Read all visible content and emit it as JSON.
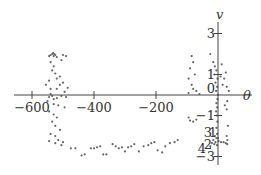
{
  "chart_data": {
    "type": "scatter",
    "title": "",
    "xlabel": "θ",
    "ylabel": "v",
    "xlim": [
      -650,
      40
    ],
    "ylim": [
      -3.3,
      3.8
    ],
    "grid": false,
    "legend": null,
    "x_ticks": [
      -600,
      -400,
      -200
    ],
    "x_tick_labels": [
      "−600",
      "−400",
      "−200"
    ],
    "y_ticks": [
      3,
      1,
      0,
      -1,
      -3
    ],
    "y_tick_labels": [
      "3",
      "1",
      "0",
      "−1",
      "−3"
    ],
    "overlapping_labels_near_origin_bottom": [
      "3",
      "1",
      "4",
      "2"
    ],
    "axes_origin": [
      0,
      0
    ],
    "marker_color": "#666666",
    "series": [
      {
        "name": "trajectory",
        "points": [
          [
            -535,
            2.0
          ],
          [
            -532,
            2.05
          ],
          [
            -528,
            2.0
          ],
          [
            -525,
            1.95
          ],
          [
            -530,
            1.9
          ],
          [
            -540,
            1.95
          ],
          [
            -545,
            1.9
          ],
          [
            -520,
            1.85
          ],
          [
            -500,
            1.95
          ],
          [
            -490,
            1.9
          ],
          [
            -505,
            1.7
          ],
          [
            -540,
            1.6
          ],
          [
            -530,
            1.4
          ],
          [
            -535,
            1.2
          ],
          [
            -525,
            1.05
          ],
          [
            -520,
            0.8
          ],
          [
            -510,
            0.9
          ],
          [
            -500,
            0.6
          ],
          [
            -545,
            0.7
          ],
          [
            -555,
            0.5
          ],
          [
            -540,
            0.3
          ],
          [
            -520,
            0.3
          ],
          [
            -510,
            0.5
          ],
          [
            -495,
            0.15
          ],
          [
            -485,
            0.35
          ],
          [
            -540,
            0.05
          ],
          [
            -535,
            -0.05
          ],
          [
            -545,
            -0.1
          ],
          [
            -530,
            -0.2
          ],
          [
            -520,
            -0.15
          ],
          [
            -505,
            -0.05
          ],
          [
            -490,
            -0.1
          ],
          [
            -550,
            -0.3
          ],
          [
            -530,
            -0.45
          ],
          [
            -515,
            -0.5
          ],
          [
            -495,
            -0.6
          ],
          [
            -545,
            -0.8
          ],
          [
            -530,
            -0.95
          ],
          [
            -520,
            -1.1
          ],
          [
            -535,
            -1.3
          ],
          [
            -525,
            -1.5
          ],
          [
            -510,
            -1.7
          ],
          [
            -540,
            -1.9
          ],
          [
            -525,
            -2.0
          ],
          [
            -515,
            -2.2
          ],
          [
            -500,
            -2.3
          ],
          [
            -545,
            -2.25
          ],
          [
            -525,
            -2.35
          ],
          [
            -505,
            -2.45
          ],
          [
            -475,
            -2.6
          ],
          [
            -460,
            -2.6
          ],
          [
            -440,
            -2.95
          ],
          [
            -430,
            -2.9
          ],
          [
            -410,
            -2.6
          ],
          [
            -400,
            -2.6
          ],
          [
            -390,
            -2.55
          ],
          [
            -380,
            -2.5
          ],
          [
            -370,
            -2.9
          ],
          [
            -360,
            -2.9
          ],
          [
            -340,
            -2.4
          ],
          [
            -330,
            -2.5
          ],
          [
            -320,
            -2.6
          ],
          [
            -310,
            -2.55
          ],
          [
            -300,
            -2.75
          ],
          [
            -290,
            -2.55
          ],
          [
            -280,
            -2.5
          ],
          [
            -270,
            -2.4
          ],
          [
            -255,
            -2.75
          ],
          [
            -240,
            -2.5
          ],
          [
            -225,
            -2.45
          ],
          [
            -215,
            -2.35
          ],
          [
            -205,
            -2.3
          ],
          [
            -195,
            -2.7
          ],
          [
            -180,
            -2.8
          ],
          [
            -170,
            -2.5
          ],
          [
            -155,
            -2.35
          ],
          [
            -140,
            -2.3
          ],
          [
            -130,
            -2.2
          ],
          [
            -85,
            1.9
          ],
          [
            -80,
            1.6
          ],
          [
            -90,
            1.3
          ],
          [
            -75,
            1.0
          ],
          [
            -95,
            0.8
          ],
          [
            -85,
            0.5
          ],
          [
            -80,
            0.3
          ],
          [
            -95,
            0.1
          ],
          [
            -70,
            0.2
          ],
          [
            -60,
            0.05
          ],
          [
            -95,
            -1.1
          ],
          [
            -90,
            -1.25
          ],
          [
            -80,
            -1.3
          ],
          [
            -70,
            -1.2
          ],
          [
            -25,
            2.0
          ],
          [
            -15,
            1.6
          ],
          [
            -10,
            1.4
          ],
          [
            -5,
            1.2
          ],
          [
            -12,
            1.0
          ],
          [
            -2,
            0.8
          ],
          [
            -8,
            0.6
          ],
          [
            -3,
            0.4
          ],
          [
            -6,
            0.2
          ],
          [
            0,
            0.0
          ],
          [
            -2,
            -0.2
          ],
          [
            -5,
            -0.4
          ],
          [
            -3,
            -0.6
          ],
          [
            -6,
            -0.8
          ],
          [
            -4,
            -1.0
          ],
          [
            -2,
            -1.3
          ],
          [
            -5,
            -1.6
          ],
          [
            -3,
            -1.9
          ],
          [
            -10,
            -2.0
          ],
          [
            -5,
            -2.1
          ],
          [
            0,
            -2.1
          ],
          [
            -15,
            -2.2
          ],
          [
            -8,
            -2.3
          ],
          [
            2,
            -2.25
          ],
          [
            -20,
            -2.35
          ],
          [
            -12,
            -2.4
          ],
          [
            -3,
            -2.45
          ],
          [
            -25,
            -2.5
          ],
          [
            10,
            -2.3
          ],
          [
            18,
            -2.3
          ],
          [
            25,
            -2.35
          ],
          [
            30,
            -2.2
          ],
          [
            12,
            1.5
          ],
          [
            25,
            1.1
          ],
          [
            20,
            0.8
          ],
          [
            15,
            0.5
          ],
          [
            8,
            0.9
          ],
          [
            28,
            0.4
          ],
          [
            35,
            0.2
          ],
          [
            30,
            -0.3
          ],
          [
            22,
            -0.5
          ],
          [
            28,
            -0.7
          ],
          [
            32,
            -1.5
          ],
          [
            28,
            -2.0
          ],
          [
            30,
            -2.4
          ]
        ]
      }
    ]
  }
}
